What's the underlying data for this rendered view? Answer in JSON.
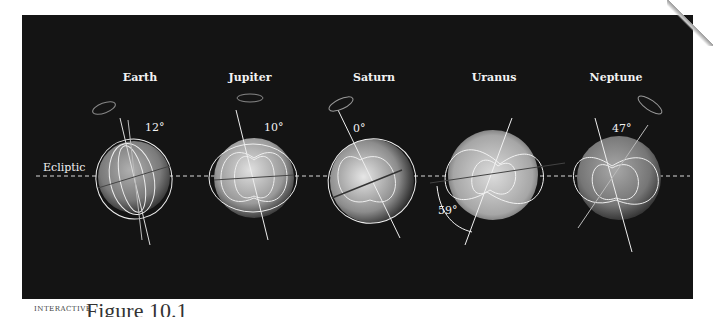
{
  "figure": {
    "background_color": "#141414",
    "line_color": "#e8e8e8",
    "ecliptic_label": "Ecliptic",
    "planets": [
      {
        "name": "Earth",
        "tilt_label": "12°",
        "cx": 134,
        "cy": 177,
        "r": 36,
        "shade": "#8a8a8a"
      },
      {
        "name": "Jupiter",
        "tilt_label": "10°",
        "cx": 254,
        "cy": 178,
        "r": 40,
        "shade": "#a8a8a8"
      },
      {
        "name": "Saturn",
        "tilt_label": "0°",
        "cx": 372,
        "cy": 181,
        "r": 42,
        "shade": "#9c9c9c"
      },
      {
        "name": "Uranus",
        "tilt_label": "59°",
        "cx": 493,
        "cy": 175,
        "r": 45,
        "shade": "#b4b4b4"
      },
      {
        "name": "Neptune",
        "tilt_label": "47°",
        "cx": 619,
        "cy": 178,
        "r": 42,
        "shade": "#858585"
      }
    ]
  },
  "footer": {
    "logo_text": "INTERACTIVE",
    "caption_start": "Figure 10.1"
  }
}
